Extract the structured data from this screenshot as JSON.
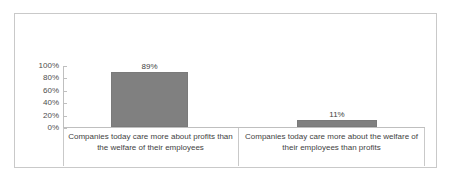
{
  "chart_data": {
    "type": "bar",
    "title": "",
    "subtitle": "",
    "xlabel": "",
    "ylabel": "",
    "categories": [
      "Companies today care more about profits than the welfare of their employees",
      "Companies today care more about the welfare of their employees than profits"
    ],
    "values": [
      89,
      11
    ],
    "data_labels": [
      "89%",
      "11%"
    ],
    "ylim": [
      0,
      100
    ],
    "y_ticks": [
      0,
      20,
      40,
      60,
      80,
      100
    ],
    "y_tick_labels": [
      "0%",
      "20%",
      "40%",
      "60%",
      "80%",
      "100%"
    ],
    "grid": false,
    "legend": false,
    "legend_position": "none",
    "series": [
      {
        "name": "",
        "values": [
          89,
          11
        ],
        "color": "#808080"
      }
    ],
    "colors": {
      "bar": "#808080",
      "bar_border": "#7a7a7a",
      "axis": "#bfbfbf",
      "frame_border": "#c9c9c9",
      "background": "#ffffff",
      "text": "#3f3f3f",
      "tick_text": "#4d4d4d"
    }
  }
}
